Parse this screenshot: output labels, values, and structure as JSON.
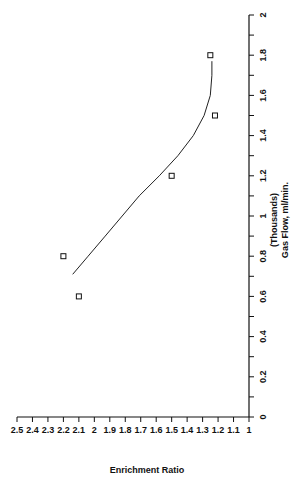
{
  "chart_data": {
    "type": "scatter",
    "title": "",
    "xlabel": "Gas Flow, ml/min.",
    "xlabel_sub": "(Thousands)",
    "ylabel": "Enrichment Ratio",
    "xlim": [
      0,
      2
    ],
    "ylim": [
      1,
      2.5
    ],
    "x_ticks": [
      "0",
      "0.2",
      "0.4",
      "0.6",
      "0.8",
      "1",
      "1.2",
      "1.4",
      "1.6",
      "1.8",
      "2"
    ],
    "y_ticks": [
      "1",
      "1.1",
      "1.2",
      "1.3",
      "1.4",
      "1.5",
      "1.6",
      "1.7",
      "1.8",
      "1.9",
      "2",
      "2.1",
      "2.2",
      "2.3",
      "2.4",
      "2.5"
    ],
    "grid": false,
    "legend": null,
    "orientation": "rotated 90 degrees counter-clockwise",
    "series": [
      {
        "name": "Observed",
        "marker": "open-square",
        "x": [
          0.6,
          0.8,
          1.2,
          1.5,
          1.8
        ],
        "y": [
          2.1,
          2.2,
          1.5,
          1.22,
          1.25
        ]
      },
      {
        "name": "Fitted curve",
        "style": "line",
        "x": [
          0.71,
          0.8,
          0.9,
          1.0,
          1.1,
          1.2,
          1.3,
          1.4,
          1.5,
          1.6,
          1.7,
          1.77
        ],
        "y": [
          2.14,
          2.04,
          1.93,
          1.82,
          1.71,
          1.58,
          1.46,
          1.36,
          1.29,
          1.25,
          1.24,
          1.24
        ]
      }
    ]
  }
}
